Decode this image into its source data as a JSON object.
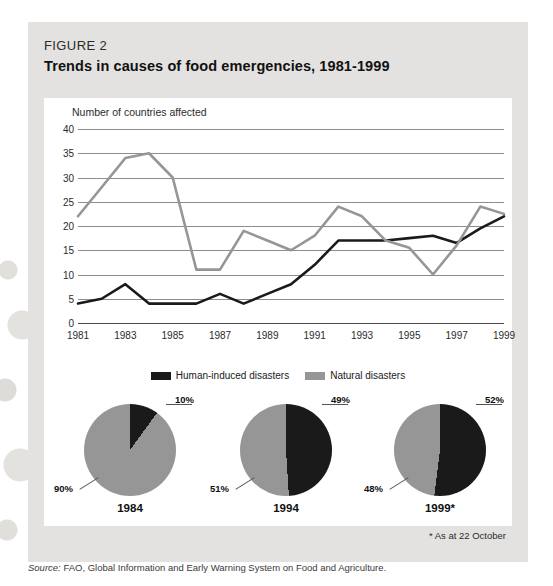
{
  "figure": {
    "label": "FIGURE 2",
    "title": "Trends in causes of food emergencies, 1981-1999",
    "footnote": "* As at 22 October",
    "source_label": "Source:",
    "source_text": " FAO, Global Information and Early Warning System on Food and Agriculture."
  },
  "colors": {
    "dark_series": "#1a1a1a",
    "light_series": "#969696",
    "panel_bg": "#ffffff",
    "figure_bg": "#e3e2e0",
    "gridline": "#8d8d8d"
  },
  "chart_data": [
    {
      "type": "line",
      "title": "Trends in causes of food emergencies, 1981-1999",
      "xlabel": "",
      "ylabel": "Number of countries affected",
      "ylim": [
        0,
        40
      ],
      "ytick_labels": [
        "40",
        "35",
        "30",
        "25",
        "20",
        "15",
        "10",
        "5",
        "0"
      ],
      "yticks": [
        40,
        35,
        30,
        25,
        20,
        15,
        10,
        5,
        0
      ],
      "grid": true,
      "legend_position": "bottom-center",
      "x": [
        1981,
        1982,
        1983,
        1984,
        1985,
        1986,
        1987,
        1988,
        1989,
        1990,
        1991,
        1992,
        1993,
        1994,
        1995,
        1996,
        1997,
        1998,
        1999
      ],
      "xtick_labels": [
        "1981",
        "1983",
        "1985",
        "1987",
        "1989",
        "1991",
        "1993",
        "1995",
        "1997",
        "1999"
      ],
      "xticks": [
        1981,
        1983,
        1985,
        1987,
        1989,
        1991,
        1993,
        1995,
        1997,
        1999
      ],
      "series": [
        {
          "name": "Human-induced disasters",
          "color": "#1a1a1a",
          "values": [
            4,
            5,
            8,
            4,
            4,
            4,
            6,
            4,
            6,
            8,
            12,
            17,
            17,
            17,
            17.5,
            18,
            16.5,
            19.5,
            22
          ]
        },
        {
          "name": "Natural disasters",
          "color": "#969696",
          "values": [
            22,
            28,
            34,
            35,
            30,
            11,
            11,
            19,
            17,
            15,
            18,
            24,
            22,
            17,
            15.5,
            10,
            16,
            24,
            22.5
          ]
        }
      ]
    },
    {
      "type": "pie",
      "title": "1984",
      "labels": [
        "Human-induced disasters",
        "Natural disasters"
      ],
      "values": [
        10,
        90
      ],
      "value_labels": [
        "10%",
        "90%"
      ],
      "colors": [
        "#1a1a1a",
        "#969696"
      ]
    },
    {
      "type": "pie",
      "title": "1994",
      "labels": [
        "Human-induced disasters",
        "Natural disasters"
      ],
      "values": [
        49,
        51
      ],
      "value_labels": [
        "49%",
        "51%"
      ],
      "colors": [
        "#1a1a1a",
        "#969696"
      ]
    },
    {
      "type": "pie",
      "title": "1999*",
      "labels": [
        "Human-induced disasters",
        "Natural disasters"
      ],
      "values": [
        52,
        48
      ],
      "value_labels": [
        "52%",
        "48%"
      ],
      "colors": [
        "#1a1a1a",
        "#969696"
      ]
    }
  ]
}
